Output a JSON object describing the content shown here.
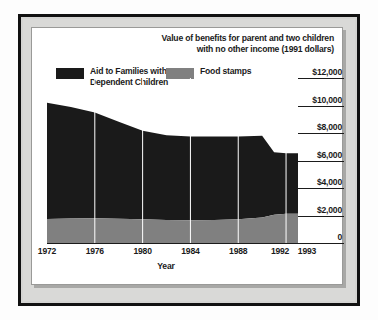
{
  "chart_data": {
    "type": "area",
    "title": "Value of benefits for parent and two children with no other income (1991 dollars)",
    "title_line1": "Value of benefits for parent and two children",
    "title_line2": "with no other income (1991 dollars)",
    "xlabel": "Year",
    "ylabel": "",
    "stacked": true,
    "grid": true,
    "legend_position": "top-left",
    "xlim": [
      1972,
      1993
    ],
    "ylim": [
      0,
      12000
    ],
    "yticks": [
      12000,
      10000,
      8000,
      6000,
      4000,
      2000,
      0
    ],
    "ytick_labels": [
      "$12,000",
      "$10,000",
      "$8,000",
      "$6,000",
      "$4,000",
      "$2,000",
      "0"
    ],
    "xticks": [
      1972,
      1976,
      1980,
      1984,
      1988,
      1992,
      1993
    ],
    "xtick_labels": [
      "1972",
      "1976",
      "1980",
      "1984",
      "1988",
      "1992",
      "1993"
    ],
    "x": [
      1972,
      1974,
      1976,
      1978,
      1980,
      1982,
      1984,
      1986,
      1988,
      1990,
      1991,
      1992,
      1993
    ],
    "series": [
      {
        "name": "Food stamps",
        "color": "#808080",
        "values": [
          1750,
          1780,
          1800,
          1760,
          1720,
          1680,
          1660,
          1680,
          1720,
          1850,
          2050,
          2120,
          2120
        ]
      },
      {
        "name": "Aid to Families with Dependent Children",
        "color": "#1a1a1a",
        "values": [
          8450,
          8120,
          7700,
          7050,
          6450,
          6150,
          6080,
          6060,
          6020,
          5950,
          4550,
          4400,
          4400
        ]
      }
    ],
    "totals": [
      10200,
      9900,
      9500,
      8810,
      8170,
      7830,
      7740,
      7740,
      7740,
      7800,
      6600,
      6520,
      6520
    ]
  },
  "legend": {
    "items": [
      {
        "label_line1": "Aid to Families with",
        "label_line2": "Dependent Children",
        "color": "#1a1a1a"
      },
      {
        "label_line1": "Food stamps",
        "label_line2": "",
        "color": "#808080"
      }
    ]
  }
}
